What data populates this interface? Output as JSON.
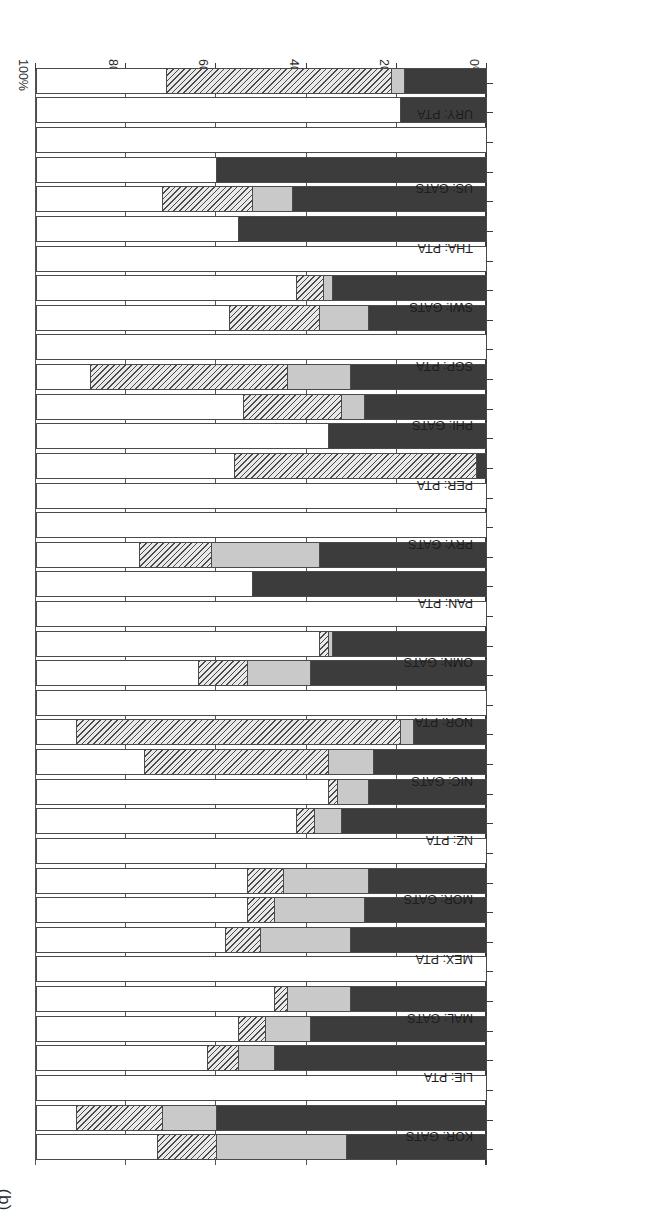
{
  "figure": {
    "panel_label": "(b)",
    "rotation_note": "180"
  },
  "chart_data": {
    "type": "bar",
    "orientation": "horizontal-stacked",
    "title": "",
    "xlabel": "",
    "ylabel": "",
    "xlim": [
      0,
      100
    ],
    "grid": true,
    "legend_position": "none",
    "tick_labels": [
      "0%",
      "20%",
      "40%",
      "60%",
      "80%",
      "100%"
    ],
    "ticks": [
      0,
      20,
      40,
      60,
      80,
      100
    ],
    "series": [
      {
        "name": "dark",
        "color": "#3c3c3c"
      },
      {
        "name": "light",
        "color": "#c9c9c9"
      },
      {
        "name": "hatch",
        "color": "#e9e9e9"
      },
      {
        "name": "white",
        "color": "#ffffff"
      }
    ],
    "categories": [
      "KOR: GATS",
      "LIE: PTA",
      "MAL: GATS",
      "MEX: PTA",
      "MOR: GATS",
      "NZ: PTA",
      "NIC: GATS",
      "NOR: PTA",
      "OMN: GATS",
      "PAN: PTA",
      "PRY: GATS",
      "PER: PTA",
      "PHI: GATS",
      "SGP: PTA",
      "SWI: GATS",
      "THA: PTA",
      "US: GATS",
      "URY: PTA"
    ],
    "bars": [
      {
        "category": "KOR: GATS",
        "pair": "a",
        "values": {
          "dark": 31,
          "light": 29,
          "hatch": 13,
          "white": 27
        }
      },
      {
        "category": "KOR: GATS",
        "pair": "b",
        "values": {
          "dark": 60,
          "light": 12,
          "hatch": 19,
          "white": 9
        }
      },
      {
        "category": "LIE: PTA",
        "pair": "a",
        "values": {
          "dark": 0,
          "light": 0,
          "hatch": 0,
          "white": 100
        }
      },
      {
        "category": "LIE: PTA",
        "pair": "b",
        "values": {
          "dark": 47,
          "light": 8,
          "hatch": 7,
          "white": 38
        }
      },
      {
        "category": "MAL: GATS",
        "pair": "a",
        "values": {
          "dark": 39,
          "light": 10,
          "hatch": 6,
          "white": 45
        }
      },
      {
        "category": "MAL: GATS",
        "pair": "b",
        "values": {
          "dark": 30,
          "light": 14,
          "hatch": 3,
          "white": 53
        }
      },
      {
        "category": "MEX: PTA",
        "pair": "a",
        "values": {
          "dark": 0,
          "light": 0,
          "hatch": 0,
          "white": 100
        }
      },
      {
        "category": "MEX: PTA",
        "pair": "b",
        "values": {
          "dark": 30,
          "light": 20,
          "hatch": 8,
          "white": 42
        }
      },
      {
        "category": "MOR: GATS",
        "pair": "a",
        "values": {
          "dark": 27,
          "light": 20,
          "hatch": 6,
          "white": 47
        }
      },
      {
        "category": "MOR: GATS",
        "pair": "b",
        "values": {
          "dark": 26,
          "light": 19,
          "hatch": 8,
          "white": 47
        }
      },
      {
        "category": "NZ: PTA",
        "pair": "a",
        "values": {
          "dark": 0,
          "light": 0,
          "hatch": 0,
          "white": 100
        }
      },
      {
        "category": "NZ: PTA",
        "pair": "b",
        "values": {
          "dark": 32,
          "light": 6,
          "hatch": 4,
          "white": 58
        }
      },
      {
        "category": "NIC: GATS",
        "pair": "a",
        "values": {
          "dark": 26,
          "light": 7,
          "hatch": 2,
          "white": 65
        }
      },
      {
        "category": "NIC: GATS",
        "pair": "b",
        "values": {
          "dark": 25,
          "light": 10,
          "hatch": 41,
          "white": 24
        }
      },
      {
        "category": "NOR: PTA",
        "pair": "a",
        "values": {
          "dark": 16,
          "light": 3,
          "hatch": 72,
          "white": 9
        }
      },
      {
        "category": "NOR: PTA",
        "pair": "b",
        "values": {
          "dark": 0,
          "light": 0,
          "hatch": 0,
          "white": 100
        }
      },
      {
        "category": "OMN: GATS",
        "pair": "a",
        "values": {
          "dark": 39,
          "light": 14,
          "hatch": 11,
          "white": 36
        }
      },
      {
        "category": "OMN: GATS",
        "pair": "b",
        "values": {
          "dark": 34,
          "light": 1,
          "hatch": 2,
          "white": 63
        }
      },
      {
        "category": "PAN: PTA",
        "pair": "a",
        "values": {
          "dark": 0,
          "light": 0,
          "hatch": 0,
          "white": 100
        }
      },
      {
        "category": "PAN: PTA",
        "pair": "b",
        "values": {
          "dark": 52,
          "light": 0,
          "hatch": 0,
          "white": 48
        }
      },
      {
        "category": "PRY: GATS",
        "pair": "a",
        "values": {
          "dark": 37,
          "light": 24,
          "hatch": 16,
          "white": 23
        }
      },
      {
        "category": "PRY: GATS",
        "pair": "b",
        "values": {
          "dark": 0,
          "light": 0,
          "hatch": 0,
          "white": 100
        }
      },
      {
        "category": "PER: PTA",
        "pair": "a",
        "values": {
          "dark": 0,
          "light": 0,
          "hatch": 0,
          "white": 100
        }
      },
      {
        "category": "PER: PTA",
        "pair": "b",
        "values": {
          "dark": 2,
          "light": 0,
          "hatch": 54,
          "white": 44
        }
      },
      {
        "category": "PHI: GATS",
        "pair": "a",
        "values": {
          "dark": 35,
          "light": 0,
          "hatch": 0,
          "white": 65
        }
      },
      {
        "category": "PHI: GATS",
        "pair": "b",
        "values": {
          "dark": 27,
          "light": 5,
          "hatch": 22,
          "white": 46
        }
      },
      {
        "category": "SGP: PTA",
        "pair": "a",
        "values": {
          "dark": 30,
          "light": 14,
          "hatch": 44,
          "white": 12
        }
      },
      {
        "category": "SGP: PTA",
        "pair": "b",
        "values": {
          "dark": 0,
          "light": 0,
          "hatch": 0,
          "white": 100
        }
      },
      {
        "category": "SWI: GATS",
        "pair": "a",
        "values": {
          "dark": 26,
          "light": 11,
          "hatch": 20,
          "white": 43
        }
      },
      {
        "category": "SWI: GATS",
        "pair": "b",
        "values": {
          "dark": 34,
          "light": 2,
          "hatch": 6,
          "white": 58
        }
      },
      {
        "category": "THA: PTA",
        "pair": "a",
        "values": {
          "dark": 0,
          "light": 0,
          "hatch": 0,
          "white": 100
        }
      },
      {
        "category": "THA: PTA",
        "pair": "b",
        "values": {
          "dark": 55,
          "light": 0,
          "hatch": 0,
          "white": 45
        }
      },
      {
        "category": "US: GATS",
        "pair": "a",
        "values": {
          "dark": 43,
          "light": 9,
          "hatch": 20,
          "white": 28
        }
      },
      {
        "category": "US: GATS",
        "pair": "b",
        "values": {
          "dark": 60,
          "light": 0,
          "hatch": 0,
          "white": 40
        }
      },
      {
        "category": "URY: PTA",
        "pair": "a",
        "values": {
          "dark": 0,
          "light": 0,
          "hatch": 0,
          "white": 100
        }
      },
      {
        "category": "URY: PTA",
        "pair": "b",
        "values": {
          "dark": 19,
          "light": 0,
          "hatch": 0,
          "white": 81
        }
      },
      {
        "category": "URY: PTA",
        "pair": "c",
        "values": {
          "dark": 18,
          "light": 3,
          "hatch": 50,
          "white": 29
        }
      }
    ]
  }
}
